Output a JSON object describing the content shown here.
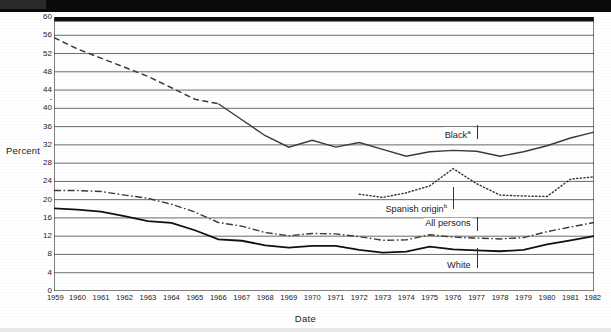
{
  "chart_data": {
    "type": "line",
    "title": "",
    "xlabel": "Date",
    "ylabel": "Percent",
    "grid": true,
    "legend_position": "inline-right",
    "xlim": [
      1959,
      1982
    ],
    "ylim": [
      0,
      60
    ],
    "ytick_step": 4,
    "yticks": [
      0,
      4,
      8,
      12,
      16,
      20,
      24,
      28,
      32,
      36,
      40,
      44,
      48,
      52,
      56,
      60
    ],
    "ytick_labels": [
      "0",
      "4",
      "8",
      "12",
      "16",
      "20",
      "24",
      "28",
      "32",
      "36",
      "40",
      "44",
      "48",
      "52",
      "56",
      "60"
    ],
    "x": [
      1959,
      1960,
      1961,
      1962,
      1963,
      1964,
      1965,
      1966,
      1967,
      1968,
      1969,
      1970,
      1971,
      1972,
      1973,
      1974,
      1975,
      1976,
      1977,
      1978,
      1979,
      1980,
      1981,
      1982
    ],
    "xtick_labels": [
      "1959",
      "1960",
      "1961",
      "1962",
      "1963",
      "1964",
      "1965",
      "1966",
      "1967",
      "1968",
      "1969",
      "1970",
      "1971",
      "1972",
      "1973",
      "1974",
      "1975",
      "1976",
      "1977",
      "1978",
      "1979",
      "1980",
      "1981",
      "1982"
    ],
    "series": [
      {
        "name": "Black",
        "label": "Black",
        "label_superscript": "a",
        "style": "dashed-then-solid",
        "color": "#3a3a3a",
        "dashed_until": 1966,
        "x": [
          1959,
          1960,
          1961,
          1962,
          1963,
          1964,
          1965,
          1966,
          1967,
          1968,
          1969,
          1970,
          1971,
          1972,
          1973,
          1974,
          1975,
          1976,
          1977,
          1978,
          1979,
          1980,
          1981,
          1982
        ],
        "values": [
          55.5,
          53.0,
          51.0,
          49.0,
          47.0,
          44.5,
          42.0,
          41.0,
          37.5,
          34.0,
          31.5,
          33.0,
          31.5,
          32.5,
          31.0,
          29.5,
          30.5,
          30.8,
          30.6,
          29.5,
          30.5,
          31.8,
          33.5,
          34.8
        ]
      },
      {
        "name": "Spanish origin",
        "label": "Spanish origin",
        "label_superscript": "b",
        "style": "dotted",
        "color": "#333333",
        "x": [
          1972,
          1973,
          1974,
          1975,
          1976,
          1977,
          1978,
          1979,
          1980,
          1981,
          1982
        ],
        "values": [
          21.2,
          20.5,
          21.5,
          23.0,
          26.8,
          23.5,
          21.0,
          20.8,
          20.7,
          24.5,
          25.0
        ]
      },
      {
        "name": "All persons",
        "label": "All persons",
        "label_superscript": "",
        "style": "dash-dot",
        "color": "#3a3a3a",
        "x": [
          1959,
          1960,
          1961,
          1962,
          1963,
          1964,
          1965,
          1966,
          1967,
          1968,
          1969,
          1970,
          1971,
          1972,
          1973,
          1974,
          1975,
          1976,
          1977,
          1978,
          1979,
          1980,
          1981,
          1982
        ],
        "values": [
          22.0,
          22.0,
          21.8,
          21.0,
          20.3,
          19.0,
          17.3,
          15.0,
          14.2,
          12.8,
          12.1,
          12.6,
          12.5,
          11.9,
          11.1,
          11.2,
          12.3,
          11.8,
          11.6,
          11.4,
          11.7,
          13.0,
          14.0,
          15.0
        ]
      },
      {
        "name": "White",
        "label": "White",
        "label_superscript": "",
        "style": "solid",
        "color": "#111111",
        "x": [
          1959,
          1960,
          1961,
          1962,
          1963,
          1964,
          1965,
          1966,
          1967,
          1968,
          1969,
          1970,
          1971,
          1972,
          1973,
          1974,
          1975,
          1976,
          1977,
          1978,
          1979,
          1980,
          1981,
          1982
        ],
        "values": [
          18.1,
          17.8,
          17.4,
          16.4,
          15.3,
          14.9,
          13.3,
          11.3,
          11.0,
          10.0,
          9.5,
          9.9,
          9.9,
          9.0,
          8.4,
          8.6,
          9.7,
          9.1,
          8.9,
          8.7,
          9.0,
          10.2,
          11.1,
          12.0
        ]
      }
    ],
    "annotations": [
      {
        "text": "Black",
        "superscript": "a",
        "x": 1977,
        "y": 34.5
      },
      {
        "text": "Spanish origin",
        "superscript": "b",
        "x": 1976,
        "y": 18.5
      },
      {
        "text": "All persons",
        "superscript": "",
        "x": 1977,
        "y": 14.6
      },
      {
        "text": "White",
        "superscript": "",
        "x": 1977,
        "y": 5.4
      }
    ]
  }
}
